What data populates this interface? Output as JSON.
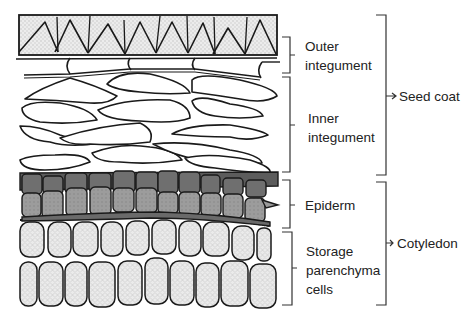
{
  "layers": {
    "outer_integument": {
      "label_line1": "Outer",
      "label_line2": "integument"
    },
    "inner_integument": {
      "label_line1": "Inner",
      "label_line2": "integument"
    },
    "epiderm": {
      "label": "Epiderm"
    },
    "storage": {
      "label_line1": "Storage",
      "label_line2": "parenchyma",
      "label_line3": "cells"
    }
  },
  "groups": {
    "seed_coat": {
      "label": "Seed coat"
    },
    "cotyledon": {
      "label": "Cotyledon"
    }
  },
  "colors": {
    "outline": "#1a1a1a",
    "palisade_fill": "#e4e4e4",
    "cell_fill": "#ffffff",
    "epiderm_dark": "#6e6e6e",
    "epiderm_mid": "#9a9a9a",
    "storage_fill": "#e2e2e2",
    "background": "#ffffff"
  }
}
